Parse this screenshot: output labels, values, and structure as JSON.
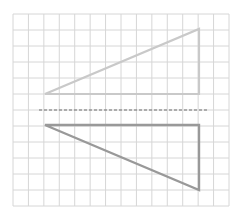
{
  "diagram": {
    "title": "",
    "type": "reflection-on-grid",
    "grid": {
      "x0": 13,
      "y0": 14,
      "x1": 229,
      "y1": 206,
      "columns": 14,
      "rows": 12,
      "color": "#d6d6d6"
    },
    "mirror_line": {
      "x1": 39,
      "y1": 110,
      "x2": 207,
      "y2": 110,
      "color": "#6f6f6f",
      "style": "dashed"
    },
    "shapes": [
      {
        "name": "original-triangle",
        "points": [
          [
            45,
            94
          ],
          [
            199,
            94
          ],
          [
            199,
            29
          ]
        ],
        "stroke": "#c9c9c9",
        "stroke_width": 2.2
      },
      {
        "name": "reflected-triangle",
        "points": [
          [
            45,
            125
          ],
          [
            199,
            125
          ],
          [
            199,
            190
          ]
        ],
        "stroke": "#999999",
        "stroke_width": 2.4
      }
    ]
  }
}
